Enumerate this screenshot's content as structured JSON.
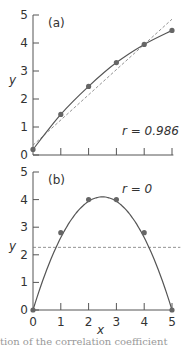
{
  "chart_data": [
    {
      "type": "scatter",
      "panel_label": "(a)",
      "xlabel": "",
      "ylabel": "y",
      "xlim": [
        0,
        5
      ],
      "ylim": [
        0,
        5
      ],
      "yticks": [
        "0",
        "1",
        "2",
        "3",
        "4",
        "5"
      ],
      "points": {
        "x": [
          0,
          1,
          2,
          3,
          4,
          5
        ],
        "y": [
          0.2,
          1.45,
          2.45,
          3.3,
          3.95,
          4.45
        ]
      },
      "curve": "concave smooth curve through points",
      "regression_line": {
        "style": "dashed",
        "from": [
          0,
          0.35
        ],
        "to": [
          5,
          4.85
        ]
      },
      "annotation": "r = 0.986"
    },
    {
      "type": "scatter",
      "panel_label": "(b)",
      "xlabel": "x",
      "ylabel": "y",
      "xlim": [
        0,
        5
      ],
      "ylim": [
        0,
        5
      ],
      "xticks": [
        "0",
        "1",
        "2",
        "3",
        "4",
        "5"
      ],
      "yticks": [
        "0",
        "1",
        "2",
        "3",
        "4",
        "5"
      ],
      "points": {
        "x": [
          0,
          1,
          2,
          3,
          4,
          5
        ],
        "y": [
          0,
          2.8,
          4,
          4,
          2.8,
          0
        ]
      },
      "curve": "parabola y = 0.8x(5 - x) style arch",
      "regression_line": {
        "style": "dashed",
        "from": [
          0,
          2.27
        ],
        "to": [
          5.3,
          2.27
        ]
      },
      "annotation": "r = 0"
    }
  ],
  "labels": {
    "a_panel": "(a)",
    "a_r": "r = 0.986",
    "a_y": "y",
    "b_panel": "(b)",
    "b_r": "r = 0",
    "b_y": "y",
    "b_x": "x",
    "caption": "tion of the correlation coefficient"
  }
}
